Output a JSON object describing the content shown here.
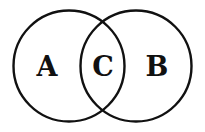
{
  "diagram": {
    "type": "venn",
    "sets": [
      {
        "id": "A",
        "label": "A"
      },
      {
        "id": "B",
        "label": "B"
      }
    ],
    "intersection": {
      "label": "C"
    },
    "stroke_color": "#111111",
    "background": "#ffffff"
  }
}
